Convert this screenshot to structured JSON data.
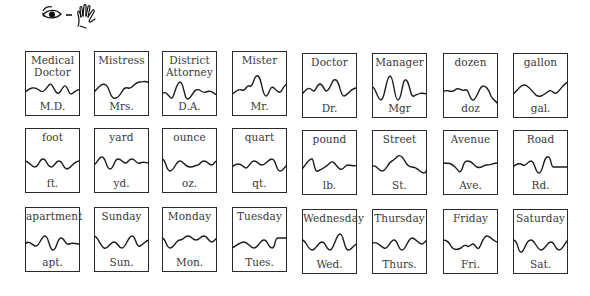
{
  "header": {
    "icons": [
      "eye-icon",
      "dash",
      "hand-icon"
    ],
    "meaning": "eye - hand (see and sign/write)"
  },
  "grid": {
    "rows": 3,
    "columns": 8,
    "cards": [
      {
        "word": "Medical Doctor",
        "abbr": "M.D.",
        "wave": "M0,40 C5,36 9,34 14,38 C18,42 20,38 24,33 C28,28 30,46 35,40 C39,34 40,30 44,40 C47,46 50,36 55,38"
      },
      {
        "word": "Mistress",
        "abbr": "Mrs.",
        "wave": "M0,40 C4,36 8,30 12,33 C16,36 16,48 22,46 C28,44 28,34 34,36 C38,38 40,30 46,30 C50,30 51,28 55,31"
      },
      {
        "word": "District Attorney",
        "abbr": "D.A.",
        "wave": "M0,42 C4,38 6,44 9,46 C12,48 14,30 18,30 C22,30 22,48 26,47 C30,46 30,40 34,38 C38,36 40,42 44,40 C48,38 50,40 55,43"
      },
      {
        "word": "Mister",
        "abbr": "Mr.",
        "wave": "M0,42 C4,40 6,36 10,38 C14,40 14,32 18,34 C21,36 22,22 26,24 C30,26 30,44 34,44 C37,44 38,32 42,36 C46,40 48,42 50,38 C52,34 54,32 55,33"
      },
      {
        "word": "Doctor",
        "abbr": "Dr.",
        "wave": "M0,40 C4,36 6,32 10,36 C14,40 14,30 18,30 C22,30 22,40 26,36 C30,32 30,24 34,26 C38,28 38,42 42,42 C46,42 48,34 55,34"
      },
      {
        "word": "Manager",
        "abbr": "Mgr",
        "wave": "M0,34 C3,30 5,46 9,46 C13,46 14,22 18,22 C22,22 22,46 26,46 C30,46 30,24 34,26 C38,28 38,44 42,42 C46,40 48,38 55,40"
      },
      {
        "word": "dozen",
        "abbr": "doz",
        "wave": "M0,38 C4,34 8,40 12,36 C16,32 18,38 22,36 C26,34 26,46 30,46 C34,46 36,32 40,32 C44,32 46,36 48,42 C50,46 52,46 55,50"
      },
      {
        "word": "gallon",
        "abbr": "gal.",
        "wave": "M0,40 C4,38 8,28 14,32 C20,36 22,44 28,42 C34,40 36,34 40,38 C44,42 46,36 50,32 C52,30 54,28 55,28"
      },
      {
        "word": "foot",
        "abbr": "ft.",
        "wave": "M0,32 C4,32 6,38 10,38 C14,38 14,30 18,30 C22,30 22,38 26,38 C30,38 30,32 34,32 C38,32 38,40 42,40 C46,40 48,32 55,32"
      },
      {
        "word": "yard",
        "abbr": "yd.",
        "wave": "M0,36 C3,34 5,28 8,28 C12,28 12,40 16,40 C20,40 20,30 24,30 C28,30 28,34 32,34 C34,34 34,30 38,30 C42,30 42,36 46,34 C50,32 52,34 55,34"
      },
      {
        "word": "ounce",
        "abbr": "oz.",
        "wave": "M0,30 C4,30 4,42 8,42 C12,42 14,32 18,32 C22,32 22,38 28,38 C32,38 34,36 36,36 C38,36 38,32 42,32 C46,32 46,36 50,36 C52,36 52,32 55,32"
      },
      {
        "word": "quart",
        "abbr": "qt.",
        "wave": "M0,38 C4,34 8,34 12,38 C16,42 18,32 22,32 C26,32 26,36 30,36 C34,36 36,30 40,30 C44,30 44,42 48,42 C52,42 52,38 55,36"
      },
      {
        "word": "pound",
        "abbr": "lb.",
        "wave": "M0,38 C4,34 6,28 10,28 C12,28 12,42 16,40 C20,38 24,36 28,32 C32,28 34,36 38,38 C42,40 42,34 46,34 C50,34 52,36 55,34"
      },
      {
        "word": "Street",
        "abbr": "St.",
        "wave": "M0,36 C4,32 6,40 10,40 C14,40 16,32 20,30 C24,28 26,22 30,26 C34,30 34,36 40,36 C46,36 48,42 52,42 C54,42 55,38 55,38"
      },
      {
        "word": "Avenue",
        "abbr": "Ave.",
        "wave": "M0,32 C6,32 8,32 12,36 C16,40 16,42 18,40 C20,38 20,30 24,30 C30,30 30,34 34,36 C38,38 40,34 44,34 C48,34 50,32 55,32"
      },
      {
        "word": "Road",
        "abbr": "Rd.",
        "wave": "M0,36 C4,32 6,32 10,34 C14,36 14,30 18,30 C22,30 22,42 26,42 C30,42 30,28 34,26 C38,24 38,36 40,36 C44,36 50,36 55,36"
      },
      {
        "word": "apartment",
        "abbr": "apt.",
        "wave": "M0,36 C4,32 6,36 10,38 C14,40 16,28 20,28 C24,28 24,42 28,42 C32,42 32,30 36,30 C40,30 40,38 44,36 C48,34 50,36 55,36"
      },
      {
        "word": "Sunday",
        "abbr": "Sun.",
        "wave": "M0,28 C4,28 6,38 10,40 C14,42 16,34 20,34 C24,34 24,40 28,40 C32,40 34,28 38,28 C42,28 42,40 46,38 C50,36 52,32 55,32"
      },
      {
        "word": "Monday",
        "abbr": "Mon.",
        "wave": "M0,30 C4,30 4,40 8,40 C12,40 14,32 18,32 C22,32 22,28 26,28 C30,28 30,32 34,32 C38,32 38,28 42,28 C46,28 46,34 50,34 C52,34 54,30 55,30"
      },
      {
        "word": "Tuesday",
        "abbr": "Tues.",
        "wave": "M0,40 C4,38 8,34 12,34 C16,34 18,40 22,40 C26,40 28,32 32,32 C36,32 36,40 40,40 C44,40 42,30 46,30 C50,30 52,30 55,30"
      },
      {
        "word": "Wednesday",
        "abbr": "Wed.",
        "wave": "M0,30 C4,30 6,40 10,40 C14,40 16,32 20,32 C24,32 24,40 28,40 C32,40 34,24 38,24 C42,24 42,40 46,40 C50,40 52,34 55,34"
      },
      {
        "word": "Thursday",
        "abbr": "Thurs.",
        "wave": "M0,34 C4,30 8,36 12,38 C16,40 18,30 22,30 C26,30 26,40 30,40 C34,40 36,28 40,28 C44,28 46,34 50,34 C52,34 54,30 55,30"
      },
      {
        "word": "Friday",
        "abbr": "Fri.",
        "wave": "M0,30 C4,30 6,32 8,36 C10,40 14,40 18,38 C20,36 22,34 24,36 C26,38 28,34 30,34 C32,34 34,40 36,38 C38,36 40,26 44,26 C48,26 50,32 55,32"
      },
      {
        "word": "Saturday",
        "abbr": "Sat.",
        "wave": "M0,30 C6,30 4,42 8,42 C12,42 12,30 18,30 C22,30 24,40 28,40 C32,40 34,32 38,32 C42,32 42,40 46,40 C50,40 52,32 55,30"
      }
    ]
  }
}
